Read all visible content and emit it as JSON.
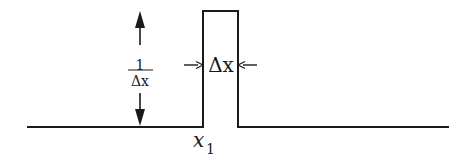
{
  "diagram": {
    "type": "rectangular-pulse",
    "height_label": {
      "numerator": "1",
      "denominator": "Δx"
    },
    "width_label": "Δx",
    "position_label": {
      "base": "x",
      "subscript": "1"
    },
    "colors": {
      "stroke": "#1a1a1a",
      "background": "#ffffff"
    }
  }
}
